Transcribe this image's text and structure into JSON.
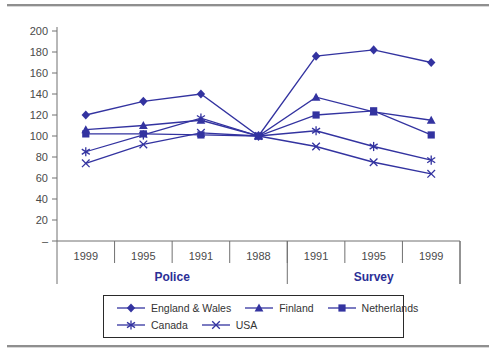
{
  "chart_data": {
    "type": "line",
    "title": "",
    "xlabel": "",
    "ylabel": "",
    "categories": [
      "1999",
      "1995",
      "1991",
      "1988",
      "1991",
      "1995",
      "1999"
    ],
    "category_groups": [
      {
        "label": "Police",
        "span": [
          0,
          3
        ]
      },
      {
        "label": "Survey",
        "span": [
          4,
          6
        ]
      }
    ],
    "series": [
      {
        "name": "England & Wales",
        "marker": "diamond",
        "values": [
          120,
          133,
          140,
          100,
          176,
          182,
          170
        ]
      },
      {
        "name": "Finland",
        "marker": "triangle",
        "values": [
          106,
          110,
          115,
          100,
          137,
          123,
          115
        ]
      },
      {
        "name": "Netherlands",
        "marker": "square",
        "values": [
          102,
          102,
          101,
          100,
          120,
          124,
          101
        ]
      },
      {
        "name": "Canada",
        "marker": "asterisk",
        "values": [
          85,
          101,
          117,
          100,
          105,
          90,
          77
        ]
      },
      {
        "name": "USA",
        "marker": "x",
        "values": [
          74,
          92,
          103,
          100,
          90,
          75,
          64
        ]
      }
    ],
    "ylim": [
      0,
      200
    ],
    "yticks": [
      0,
      20,
      40,
      60,
      80,
      100,
      120,
      140,
      160,
      180,
      200
    ],
    "zero_tick_label": "–",
    "grid": false,
    "legend_position": "bottom-box",
    "legend_rows": [
      3,
      2
    ],
    "line_color": "#3333A0",
    "group_label_color": "#2B2F96",
    "axis_line_color": "#707070",
    "axis_text_color": "#4A4A4A",
    "rule_color": "#8F8F8F"
  }
}
